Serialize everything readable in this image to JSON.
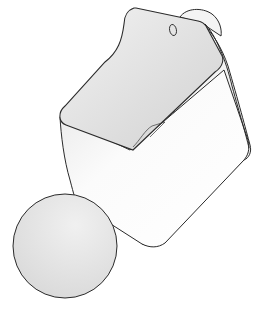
{
  "illustration": {
    "subject": "wall-mounted-container",
    "colors": {
      "background": "#ffffff",
      "outline": "#2a2a2a",
      "body_light": "#f7f7f7",
      "body_shade": "#e4e4e4",
      "inner_back": "#dcdcdc",
      "inner_back_light": "#efefef",
      "lens_fill": "#e2e2e2",
      "lens_highlight": "#f2f2f2"
    },
    "parts": [
      "container-body",
      "back-plate",
      "hanging-hole",
      "wall-bracket",
      "inner-divider",
      "texture-magnifier-circle"
    ]
  }
}
